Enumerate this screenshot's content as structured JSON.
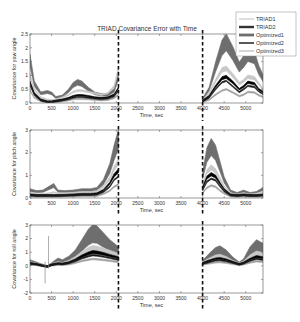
{
  "chart_data": [
    {
      "type": "area",
      "title": "TRIAD Covariance Error with Time",
      "xlabel": "Time, sec",
      "ylabel": "Covariance for yaw angle",
      "xlim": [
        0,
        5400
      ],
      "ylim": [
        0,
        2.5
      ],
      "xticks": [
        0,
        500,
        1000,
        1500,
        2000,
        2500,
        3000,
        3500,
        4000,
        4500,
        5000
      ],
      "xtick_labels": [
        "0",
        "500",
        "1000",
        "1500",
        "2000",
        "2500",
        "3000",
        "3500",
        "4000",
        "4500",
        "5000"
      ],
      "yticks": [
        0,
        0.5,
        1,
        1.5,
        2,
        2.5
      ],
      "ytick_labels": [
        "0",
        "0.5",
        "1",
        "1.5",
        "2",
        "2.5"
      ],
      "gap": [
        2050,
        4000
      ],
      "dashed_lines": [
        2050,
        4000
      ],
      "legend": {
        "placement": "top-right",
        "entries": [
          "TRIAD1",
          "TRIAD2",
          "Optimized1",
          "Optimized2",
          "Optimized3"
        ]
      },
      "series": [
        {
          "name": "Optimized1",
          "x": [
            0,
            100,
            250,
            400,
            500,
            600,
            750,
            900,
            1000,
            1100,
            1200,
            1350,
            1500,
            1650,
            1800,
            1950,
            2050,
            4000,
            4150,
            4300,
            4450,
            4550,
            4700,
            4850,
            4950,
            5050,
            5200,
            5300,
            5400
          ],
          "y": [
            1.55,
            0.7,
            0.35,
            0.4,
            0.35,
            0.2,
            0.25,
            0.45,
            0.65,
            0.75,
            0.7,
            0.5,
            0.35,
            0.3,
            0.3,
            0.45,
            1.0,
            0.15,
            0.5,
            1.3,
            2.0,
            2.2,
            1.8,
            1.3,
            1.5,
            1.75,
            1.65,
            1.2,
            0.9
          ]
        },
        {
          "name": "TRIAD1",
          "x": [
            0,
            100,
            250,
            400,
            500,
            600,
            750,
            900,
            1000,
            1100,
            1200,
            1350,
            1500,
            1650,
            1800,
            1950,
            2050,
            4000,
            4150,
            4300,
            4450,
            4550,
            4700,
            4850,
            4950,
            5050,
            5200,
            5300,
            5400
          ],
          "y": [
            1.0,
            0.5,
            0.2,
            0.12,
            0.1,
            0.12,
            0.2,
            0.3,
            0.4,
            0.45,
            0.45,
            0.4,
            0.35,
            0.3,
            0.35,
            0.6,
            1.25,
            0.1,
            0.35,
            0.8,
            1.2,
            1.25,
            1.0,
            0.7,
            0.8,
            0.95,
            0.9,
            0.7,
            0.5
          ]
        },
        {
          "name": "TRIAD2",
          "x": [
            0,
            100,
            250,
            400,
            500,
            600,
            750,
            900,
            1000,
            1100,
            1200,
            1350,
            1500,
            1650,
            1800,
            1950,
            2050,
            4000,
            4150,
            4300,
            4450,
            4550,
            4700,
            4850,
            4950,
            5050,
            5200,
            5300,
            5400
          ],
          "y": [
            0.75,
            0.35,
            0.12,
            0.05,
            0.05,
            0.08,
            0.12,
            0.18,
            0.25,
            0.28,
            0.28,
            0.25,
            0.2,
            0.18,
            0.2,
            0.3,
            0.55,
            0.08,
            0.25,
            0.6,
            0.9,
            0.95,
            0.75,
            0.5,
            0.6,
            0.75,
            0.7,
            0.5,
            0.4
          ]
        },
        {
          "name": "Optimized2",
          "x": [
            0,
            100,
            250,
            400,
            500,
            600,
            750,
            900,
            1000,
            1100,
            1200,
            1350,
            1500,
            1650,
            1800,
            1950,
            2050,
            4000,
            4150,
            4300,
            4450,
            4550,
            4700,
            4850,
            4950,
            5050,
            5200,
            5300,
            5400
          ],
          "y": [
            0.65,
            0.3,
            0.1,
            0.04,
            0.04,
            0.06,
            0.1,
            0.15,
            0.2,
            0.22,
            0.22,
            0.2,
            0.17,
            0.15,
            0.17,
            0.25,
            0.45,
            0.06,
            0.2,
            0.5,
            0.75,
            0.8,
            0.6,
            0.4,
            0.5,
            0.62,
            0.58,
            0.42,
            0.33
          ]
        },
        {
          "name": "Optimized3",
          "x": [
            0,
            100,
            250,
            400,
            500,
            600,
            750,
            900,
            1000,
            1100,
            1200,
            1350,
            1500,
            1650,
            1800,
            1950,
            2050,
            4000,
            4150,
            4300,
            4450,
            4550,
            4700,
            4850,
            4950,
            5050,
            5200,
            5300,
            5400
          ],
          "y": [
            0.45,
            0.2,
            0.07,
            0.03,
            0.03,
            0.04,
            0.07,
            0.1,
            0.14,
            0.15,
            0.15,
            0.14,
            0.12,
            0.1,
            0.12,
            0.18,
            0.3,
            0.04,
            0.12,
            0.3,
            0.45,
            0.5,
            0.38,
            0.25,
            0.3,
            0.4,
            0.38,
            0.28,
            0.22
          ]
        }
      ]
    },
    {
      "type": "area",
      "title": "",
      "xlabel": "Time, sec",
      "ylabel": "Covariance for pitch angle",
      "xlim": [
        0,
        5400
      ],
      "ylim": [
        0,
        3
      ],
      "xticks": [
        0,
        500,
        1000,
        1500,
        2000,
        2500,
        3000,
        3500,
        4000,
        4500,
        5000
      ],
      "xtick_labels": [
        "0",
        "500",
        "1000",
        "1500",
        "2000",
        "2500",
        "3000",
        "3500",
        "4000",
        "4500",
        "5000"
      ],
      "yticks": [
        0,
        1,
        2,
        3
      ],
      "ytick_labels": [
        "0",
        "1",
        "2",
        "3"
      ],
      "gap": [
        2050,
        4000
      ],
      "dashed_lines": [
        2050,
        4000
      ],
      "series": [
        {
          "name": "Optimized1",
          "x": [
            0,
            150,
            300,
            450,
            550,
            650,
            800,
            1000,
            1200,
            1400,
            1550,
            1700,
            1850,
            1950,
            2050,
            4000,
            4100,
            4200,
            4300,
            4400,
            4500,
            4650,
            4800,
            4950,
            5100,
            5250,
            5400
          ],
          "y": [
            0.35,
            0.28,
            0.3,
            0.45,
            0.55,
            0.3,
            0.28,
            0.3,
            0.35,
            0.35,
            0.4,
            0.7,
            1.3,
            2.0,
            2.6,
            1.0,
            1.9,
            2.25,
            2.0,
            1.4,
            0.8,
            0.3,
            0.2,
            0.3,
            0.2,
            0.25,
            0.4
          ]
        },
        {
          "name": "TRIAD1",
          "x": [
            0,
            150,
            300,
            450,
            550,
            650,
            800,
            1000,
            1200,
            1400,
            1550,
            1700,
            1850,
            1950,
            2050,
            4000,
            4100,
            4200,
            4300,
            4400,
            4500,
            4650,
            4800,
            4950,
            5100,
            5250,
            5400
          ],
          "y": [
            0.22,
            0.18,
            0.18,
            0.2,
            0.25,
            0.2,
            0.2,
            0.22,
            0.25,
            0.25,
            0.3,
            0.5,
            0.85,
            1.3,
            1.6,
            0.6,
            1.15,
            1.35,
            1.2,
            0.85,
            0.5,
            0.2,
            0.15,
            0.2,
            0.15,
            0.18,
            0.25
          ]
        },
        {
          "name": "TRIAD2",
          "x": [
            0,
            150,
            300,
            450,
            550,
            650,
            800,
            1000,
            1200,
            1400,
            1550,
            1700,
            1850,
            1950,
            2050,
            4000,
            4100,
            4200,
            4300,
            4400,
            4500,
            4650,
            4800,
            4950,
            5100,
            5250,
            5400
          ],
          "y": [
            0.15,
            0.12,
            0.12,
            0.12,
            0.12,
            0.12,
            0.13,
            0.15,
            0.17,
            0.17,
            0.2,
            0.35,
            0.65,
            1.0,
            1.2,
            0.45,
            0.9,
            1.05,
            0.95,
            0.65,
            0.38,
            0.15,
            0.12,
            0.15,
            0.12,
            0.12,
            0.15
          ]
        },
        {
          "name": "Optimized2",
          "x": [
            0,
            150,
            300,
            450,
            550,
            650,
            800,
            1000,
            1200,
            1400,
            1550,
            1700,
            1850,
            1950,
            2050,
            4000,
            4100,
            4200,
            4300,
            4400,
            4500,
            4650,
            4800,
            4950,
            5100,
            5250,
            5400
          ],
          "y": [
            0.12,
            0.1,
            0.1,
            0.1,
            0.1,
            0.1,
            0.11,
            0.12,
            0.14,
            0.14,
            0.16,
            0.28,
            0.5,
            0.8,
            0.95,
            0.35,
            0.72,
            0.85,
            0.78,
            0.52,
            0.3,
            0.12,
            0.1,
            0.12,
            0.1,
            0.1,
            0.12
          ]
        },
        {
          "name": "Optimized3",
          "x": [
            0,
            150,
            300,
            450,
            550,
            650,
            800,
            1000,
            1200,
            1400,
            1550,
            1700,
            1850,
            1950,
            2050,
            4000,
            4100,
            4200,
            4300,
            4400,
            4500,
            4650,
            4800,
            4950,
            5100,
            5250,
            5400
          ],
          "y": [
            0.08,
            0.06,
            0.06,
            0.06,
            0.06,
            0.06,
            0.07,
            0.08,
            0.09,
            0.09,
            0.1,
            0.18,
            0.32,
            0.5,
            0.6,
            0.22,
            0.45,
            0.55,
            0.5,
            0.33,
            0.2,
            0.08,
            0.06,
            0.08,
            0.06,
            0.06,
            0.08
          ]
        }
      ]
    },
    {
      "type": "area",
      "title": "",
      "xlabel": "Time, sec",
      "ylabel": "Covariance for roll angle",
      "xlim": [
        0,
        5400
      ],
      "ylim": [
        -2,
        3
      ],
      "xticks": [
        0,
        500,
        1000,
        1500,
        2000,
        2500,
        3000,
        3500,
        4000,
        4500,
        5000
      ],
      "xtick_labels": [
        "0",
        "500",
        "1000",
        "1500",
        "2000",
        "2500",
        "3000",
        "3500",
        "4000",
        "4500",
        "5000"
      ],
      "yticks": [
        -2,
        -1,
        0,
        1,
        2,
        3
      ],
      "ytick_labels": [
        "-2",
        "-1",
        "0",
        "1",
        "2",
        "3"
      ],
      "gap": [
        2050,
        4000
      ],
      "dashed_lines": [
        2050,
        4000
      ],
      "spikes": [
        {
          "x": 350,
          "ymin": -1.3,
          "ymax": 0.3
        },
        {
          "x": 430,
          "ymin": -0.2,
          "ymax": 2.2
        }
      ],
      "series": [
        {
          "name": "Optimized1",
          "x": [
            0,
            150,
            300,
            400,
            500,
            650,
            750,
            900,
            1050,
            1200,
            1350,
            1450,
            1550,
            1700,
            1850,
            2050,
            4000,
            4150,
            4300,
            4400,
            4550,
            4700,
            4850,
            4950,
            5100,
            5250,
            5400
          ],
          "y": [
            0.35,
            0.2,
            0.05,
            -0.05,
            0.15,
            0.45,
            0.35,
            0.55,
            0.9,
            1.5,
            2.1,
            2.35,
            2.3,
            1.9,
            1.5,
            1.1,
            0.3,
            0.7,
            1.05,
            1.15,
            0.9,
            0.5,
            0.2,
            0.4,
            1.1,
            1.5,
            1.3
          ]
        },
        {
          "name": "TRIAD1",
          "x": [
            0,
            150,
            300,
            400,
            500,
            650,
            750,
            900,
            1050,
            1200,
            1350,
            1450,
            1550,
            1700,
            1850,
            2050,
            4000,
            4150,
            4300,
            4400,
            4550,
            4700,
            4850,
            4950,
            5100,
            5250,
            5400
          ],
          "y": [
            0.25,
            0.15,
            0.02,
            -0.05,
            0.1,
            0.25,
            0.2,
            0.35,
            0.6,
            0.9,
            1.2,
            1.3,
            1.28,
            1.15,
            1.0,
            0.8,
            0.25,
            0.5,
            0.7,
            0.75,
            0.6,
            0.35,
            0.15,
            0.3,
            0.7,
            0.95,
            0.85
          ]
        },
        {
          "name": "TRIAD2",
          "x": [
            0,
            150,
            300,
            400,
            500,
            650,
            750,
            900,
            1050,
            1200,
            1350,
            1450,
            1550,
            1700,
            1850,
            2050,
            4000,
            4150,
            4300,
            4400,
            4550,
            4700,
            4850,
            4950,
            5100,
            5250,
            5400
          ],
          "y": [
            0.2,
            0.12,
            0.0,
            -0.05,
            0.08,
            0.18,
            0.15,
            0.25,
            0.45,
            0.7,
            0.9,
            1.0,
            0.98,
            0.88,
            0.75,
            0.6,
            0.2,
            0.38,
            0.52,
            0.55,
            0.45,
            0.28,
            0.12,
            0.22,
            0.5,
            0.68,
            0.6
          ]
        },
        {
          "name": "Optimized2",
          "x": [
            0,
            150,
            300,
            400,
            500,
            650,
            750,
            900,
            1050,
            1200,
            1350,
            1450,
            1550,
            1700,
            1850,
            2050,
            4000,
            4150,
            4300,
            4400,
            4550,
            4700,
            4850,
            4950,
            5100,
            5250,
            5400
          ],
          "y": [
            0.15,
            0.1,
            0.0,
            -0.05,
            0.06,
            0.14,
            0.12,
            0.2,
            0.35,
            0.55,
            0.7,
            0.78,
            0.76,
            0.68,
            0.58,
            0.45,
            0.15,
            0.28,
            0.4,
            0.42,
            0.35,
            0.22,
            0.1,
            0.18,
            0.38,
            0.52,
            0.45
          ]
        },
        {
          "name": "Optimized3",
          "x": [
            0,
            150,
            300,
            400,
            500,
            650,
            750,
            900,
            1050,
            1200,
            1350,
            1450,
            1550,
            1700,
            1850,
            2050,
            4000,
            4150,
            4300,
            4400,
            4550,
            4700,
            4850,
            4950,
            5100,
            5250,
            5400
          ],
          "y": [
            0.1,
            0.06,
            0.0,
            -0.05,
            0.04,
            0.09,
            0.08,
            0.12,
            0.22,
            0.35,
            0.45,
            0.5,
            0.48,
            0.43,
            0.37,
            0.28,
            0.1,
            0.18,
            0.25,
            0.27,
            0.22,
            0.14,
            0.06,
            0.11,
            0.24,
            0.33,
            0.29
          ]
        }
      ]
    }
  ],
  "colors": {
    "TRIAD1": "#c8c8c8",
    "TRIAD2": "#000000",
    "Optimized1": "#6e6e6e",
    "Optimized2": "#1a1a1a",
    "Optimized3": "#a0a0a0",
    "axis": "#555555",
    "dashed": "#111111"
  }
}
